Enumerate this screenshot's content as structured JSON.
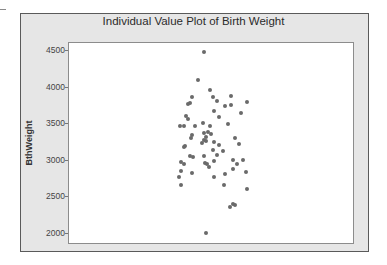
{
  "chart_data": {
    "type": "scatter",
    "subtype": "individual-value-plot",
    "title": "Individual Value Plot of Birth Weight",
    "xlabel": "",
    "ylabel": "BthWeight",
    "ylim": [
      1850,
      4620
    ],
    "yticks": [
      2000,
      2500,
      3000,
      3500,
      4000,
      4500
    ],
    "ytick_labels": [
      "2000",
      "2500",
      "3000",
      "3500",
      "4000",
      "4500"
    ],
    "grid": false,
    "legend": null,
    "colors": {
      "frame_bg": "#e6e6e6",
      "plot_bg": "#ffffff",
      "point": "#6a6a6a",
      "border": "#5a5a5a"
    },
    "points": [
      {
        "jitter": 204,
        "value": 4469
      },
      {
        "jitter": 198,
        "value": 4086
      },
      {
        "jitter": 210,
        "value": 3949
      },
      {
        "jitter": 192,
        "value": 3854
      },
      {
        "jitter": 213,
        "value": 3858
      },
      {
        "jitter": 231,
        "value": 3872
      },
      {
        "jitter": 217,
        "value": 3803
      },
      {
        "jitter": 190,
        "value": 3771
      },
      {
        "jitter": 188,
        "value": 3762
      },
      {
        "jitter": 231,
        "value": 3749
      },
      {
        "jitter": 225,
        "value": 3731
      },
      {
        "jitter": 247,
        "value": 3786
      },
      {
        "jitter": 214,
        "value": 3667
      },
      {
        "jitter": 241,
        "value": 3639
      },
      {
        "jitter": 219,
        "value": 3580
      },
      {
        "jitter": 186,
        "value": 3603
      },
      {
        "jitter": 188,
        "value": 3561
      },
      {
        "jitter": 228,
        "value": 3493
      },
      {
        "jitter": 203,
        "value": 3503
      },
      {
        "jitter": 180,
        "value": 3458
      },
      {
        "jitter": 184,
        "value": 3458
      },
      {
        "jitter": 195,
        "value": 3458
      },
      {
        "jitter": 210,
        "value": 3467
      },
      {
        "jitter": 192,
        "value": 3343
      },
      {
        "jitter": 204,
        "value": 3362
      },
      {
        "jitter": 208,
        "value": 3380
      },
      {
        "jitter": 211,
        "value": 3352
      },
      {
        "jitter": 206,
        "value": 3316
      },
      {
        "jitter": 191,
        "value": 3294
      },
      {
        "jitter": 235,
        "value": 3303
      },
      {
        "jitter": 204,
        "value": 3270
      },
      {
        "jitter": 206,
        "value": 3261
      },
      {
        "jitter": 202,
        "value": 3234
      },
      {
        "jitter": 214,
        "value": 3248
      },
      {
        "jitter": 239,
        "value": 3212
      },
      {
        "jitter": 185,
        "value": 3193
      },
      {
        "jitter": 184,
        "value": 3170
      },
      {
        "jitter": 219,
        "value": 3202
      },
      {
        "jitter": 213,
        "value": 3129
      },
      {
        "jitter": 223,
        "value": 3120
      },
      {
        "jitter": 217,
        "value": 3070
      },
      {
        "jitter": 190,
        "value": 3047
      },
      {
        "jitter": 193,
        "value": 3038
      },
      {
        "jitter": 204,
        "value": 3052
      },
      {
        "jitter": 181,
        "value": 2974
      },
      {
        "jitter": 184,
        "value": 2947
      },
      {
        "jitter": 214,
        "value": 2979
      },
      {
        "jitter": 233,
        "value": 2993
      },
      {
        "jitter": 243,
        "value": 3002
      },
      {
        "jitter": 205,
        "value": 2961
      },
      {
        "jitter": 207,
        "value": 2947
      },
      {
        "jitter": 237,
        "value": 2947
      },
      {
        "jitter": 209,
        "value": 2897
      },
      {
        "jitter": 233,
        "value": 2879
      },
      {
        "jitter": 181,
        "value": 2847
      },
      {
        "jitter": 192,
        "value": 2824
      },
      {
        "jitter": 246,
        "value": 2829
      },
      {
        "jitter": 225,
        "value": 2806
      },
      {
        "jitter": 179,
        "value": 2761
      },
      {
        "jitter": 214,
        "value": 2761
      },
      {
        "jitter": 181,
        "value": 2652
      },
      {
        "jitter": 224,
        "value": 2652
      },
      {
        "jitter": 247,
        "value": 2597
      },
      {
        "jitter": 233,
        "value": 2396
      },
      {
        "jitter": 230,
        "value": 2359
      },
      {
        "jitter": 235,
        "value": 2378
      },
      {
        "jitter": 206,
        "value": 1996
      }
    ]
  }
}
